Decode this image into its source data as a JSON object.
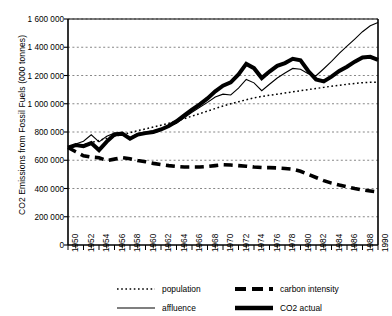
{
  "chart_data": {
    "type": "line",
    "title": "",
    "xlabel": "",
    "ylabel": "CO2 Emissions from Fossil Fuels (000 tonnes)",
    "xlim": [
      1950,
      1990
    ],
    "ylim": [
      0,
      1600000
    ],
    "grid": true,
    "grid_axis": "y",
    "legend_position": "bottom",
    "ytick_labels": [
      "1 600 000",
      "1 400 000",
      "1 200 000",
      "1 000 000",
      "800 000",
      "600 000",
      "400 000",
      "200 000",
      "0"
    ],
    "ytick_values": [
      1600000,
      1400000,
      1200000,
      1000000,
      800000,
      600000,
      400000,
      200000,
      0
    ],
    "xtick_labels": [
      "1950",
      "1952",
      "1954",
      "1956",
      "1958",
      "1960",
      "1962",
      "1964",
      "1966",
      "1968",
      "1970",
      "1972",
      "1974",
      "1976",
      "1978",
      "1980",
      "1982",
      "1984",
      "1986",
      "1988",
      "1990"
    ],
    "xtick_values": [
      1950,
      1952,
      1954,
      1956,
      1958,
      1960,
      1962,
      1964,
      1966,
      1968,
      1970,
      1972,
      1974,
      1976,
      1978,
      1980,
      1982,
      1984,
      1986,
      1988,
      1990
    ],
    "minor_xticks_every": 1,
    "x": [
      1950,
      1951,
      1952,
      1953,
      1954,
      1955,
      1956,
      1957,
      1958,
      1959,
      1960,
      1961,
      1962,
      1963,
      1964,
      1965,
      1966,
      1967,
      1968,
      1969,
      1970,
      1971,
      1972,
      1973,
      1974,
      1975,
      1976,
      1977,
      1978,
      1979,
      1980,
      1981,
      1982,
      1983,
      1984,
      1985,
      1986,
      1987,
      1988,
      1989,
      1990
    ],
    "series": [
      {
        "name": "population",
        "style": "dotted",
        "linewidth": 1.4,
        "color": "#000000",
        "values": [
          690000,
          700000,
          710000,
          725000,
          740000,
          755000,
          770000,
          782000,
          795000,
          810000,
          822000,
          835000,
          848000,
          862000,
          878000,
          895000,
          912000,
          930000,
          948000,
          966000,
          984000,
          1000000,
          1014000,
          1028000,
          1042000,
          1052000,
          1060000,
          1068000,
          1076000,
          1084000,
          1092000,
          1100000,
          1108000,
          1116000,
          1124000,
          1131000,
          1138000,
          1144000,
          1149000,
          1152000,
          1152000
        ]
      },
      {
        "name": "affluence",
        "style": "solid",
        "linewidth": 1,
        "color": "#000000",
        "values": [
          688000,
          715000,
          735000,
          780000,
          730000,
          770000,
          792000,
          790000,
          760000,
          790000,
          800000,
          808000,
          822000,
          840000,
          862000,
          900000,
          940000,
          975000,
          1010000,
          1048000,
          1068000,
          1062000,
          1110000,
          1172000,
          1148000,
          1092000,
          1138000,
          1182000,
          1218000,
          1250000,
          1244000,
          1212000,
          1198000,
          1248000,
          1300000,
          1356000,
          1408000,
          1458000,
          1510000,
          1552000,
          1575000
        ]
      },
      {
        "name": "carbon intensity",
        "style": "dashed",
        "linewidth": 3.4,
        "color": "#000000",
        "values": [
          690000,
          660000,
          632000,
          622000,
          618000,
          598000,
          608000,
          618000,
          610000,
          598000,
          590000,
          578000,
          570000,
          562000,
          556000,
          552000,
          552000,
          552000,
          556000,
          562000,
          568000,
          566000,
          562000,
          558000,
          552000,
          548000,
          548000,
          546000,
          542000,
          536000,
          522000,
          500000,
          478000,
          456000,
          438000,
          424000,
          412000,
          400000,
          390000,
          382000,
          375000
        ]
      },
      {
        "name": "CO2 actual",
        "style": "solid",
        "linewidth": 3.8,
        "color": "#000000",
        "values": [
          690000,
          708000,
          700000,
          722000,
          672000,
          732000,
          782000,
          788000,
          752000,
          782000,
          792000,
          800000,
          818000,
          842000,
          876000,
          918000,
          958000,
          996000,
          1038000,
          1088000,
          1128000,
          1152000,
          1208000,
          1282000,
          1252000,
          1182000,
          1228000,
          1268000,
          1288000,
          1318000,
          1308000,
          1232000,
          1172000,
          1158000,
          1192000,
          1232000,
          1262000,
          1298000,
          1328000,
          1332000,
          1310000
        ]
      }
    ]
  },
  "legend": {
    "entries": [
      {
        "label": "population",
        "style": "dotted"
      },
      {
        "label": "carbon intensity",
        "style": "dashed"
      },
      {
        "label": "affluence",
        "style": "thin-solid"
      },
      {
        "label": "CO2 actual",
        "style": "thick-solid"
      }
    ]
  }
}
